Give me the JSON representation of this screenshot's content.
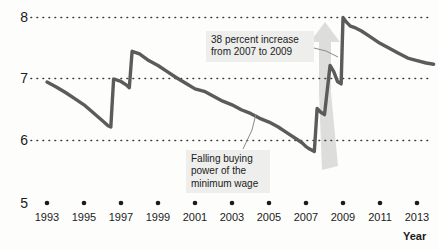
{
  "chart_data": {
    "type": "line",
    "title": "",
    "xlabel": "Year",
    "ylabel": "",
    "xlim": [
      1992.5,
      2014.0
    ],
    "ylim": [
      5,
      8
    ],
    "grid": true,
    "gridlines_y": [
      6,
      7,
      8
    ],
    "legend": "none",
    "y_ticklabels": [
      "8",
      "7",
      "6",
      "5"
    ],
    "y_tickvalues": [
      8,
      7,
      6,
      5
    ],
    "x_ticklabels": [
      "1993",
      "1995",
      "1997",
      "1999",
      "2001",
      "2003",
      "2005",
      "2007",
      "2009",
      "2011",
      "2013"
    ],
    "x_tickvalues": [
      1993,
      1995,
      1997,
      1999,
      2001,
      2003,
      2005,
      2007,
      2009,
      2011,
      2013
    ],
    "series": [
      {
        "name": "Real value of the federal minimum wage",
        "color": "#5b5b5b",
        "x": [
          1993.0,
          1993.5,
          1994.0,
          1994.5,
          1995.0,
          1995.5,
          1996.0,
          1996.3,
          1996.45,
          1996.6,
          1997.0,
          1997.3,
          1997.45,
          1997.6,
          1998.0,
          1998.5,
          1999.0,
          1999.5,
          2000.0,
          2000.5,
          2001.0,
          2001.5,
          2002.0,
          2002.5,
          2003.0,
          2003.5,
          2004.0,
          2004.5,
          2005.0,
          2005.5,
          2006.0,
          2006.5,
          2006.8,
          2007.0,
          2007.2,
          2007.45,
          2007.6,
          2007.8,
          2008.0,
          2008.3,
          2008.5,
          2008.7,
          2008.9,
          2009.0,
          2009.2,
          2009.4,
          2009.6,
          2010.0,
          2010.5,
          2011.0,
          2011.5,
          2012.0,
          2012.5,
          2013.0,
          2013.5,
          2013.9
        ],
        "y": [
          6.95,
          6.87,
          6.78,
          6.68,
          6.58,
          6.45,
          6.32,
          6.24,
          6.22,
          7.0,
          6.96,
          6.9,
          6.86,
          7.45,
          7.41,
          7.3,
          7.22,
          7.12,
          7.02,
          6.93,
          6.84,
          6.8,
          6.72,
          6.64,
          6.58,
          6.5,
          6.44,
          6.36,
          6.3,
          6.22,
          6.12,
          6.02,
          5.96,
          5.9,
          5.86,
          5.82,
          6.52,
          6.46,
          6.42,
          7.22,
          7.12,
          6.96,
          6.92,
          8.0,
          7.92,
          7.86,
          7.84,
          7.78,
          7.68,
          7.58,
          7.5,
          7.42,
          7.34,
          7.3,
          7.26,
          7.24
        ]
      }
    ],
    "annotations": [
      {
        "id": "increase",
        "text": "38 percent increase\nfrom 2007 to 2009",
        "target_x": 2008.8,
        "target_y": 7.3
      },
      {
        "id": "falling",
        "text": "Falling buying\npower of the\nminimum wage",
        "target_x": 2004.0,
        "target_y": 6.44
      }
    ],
    "shapes": [
      {
        "id": "growth-arrow",
        "type": "arrow",
        "direction": "up",
        "color": "#dcdcdc",
        "from_x": 2007.6,
        "from_y": 5.85,
        "to_x": 2008.9,
        "to_y": 7.95
      }
    ]
  },
  "axes": {
    "y_labels": [
      {
        "value": "8"
      },
      {
        "value": "7"
      },
      {
        "value": "6"
      },
      {
        "value": "5"
      }
    ],
    "x_labels": [
      {
        "value": "1993"
      },
      {
        "value": "1995"
      },
      {
        "value": "1997"
      },
      {
        "value": "1999"
      },
      {
        "value": "2001"
      },
      {
        "value": "2003"
      },
      {
        "value": "2005"
      },
      {
        "value": "2007"
      },
      {
        "value": "2009"
      },
      {
        "value": "2011"
      },
      {
        "value": "2013"
      }
    ],
    "x_axis_title": "Year"
  },
  "annotations": {
    "increase": {
      "text": "38 percent increase\nfrom 2007 to 2009"
    },
    "falling": {
      "text": "Falling buying\npower of the\nminimum wage"
    }
  },
  "colors": {
    "line": "#5b5b5b",
    "arrow": "#dcdcdc",
    "grid": "#3a3a3a",
    "text": "#1b1b1b",
    "annotation_bg": "#eeeeec",
    "background": "#fdfdfc"
  }
}
